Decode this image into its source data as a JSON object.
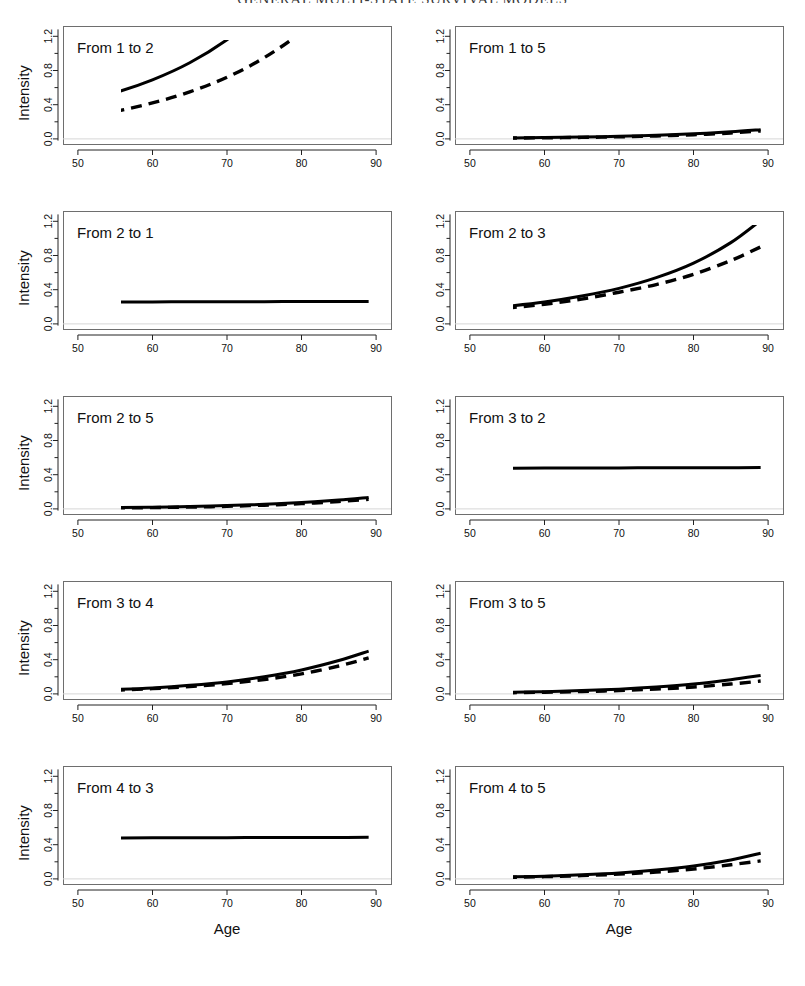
{
  "running_head": "GENERAL MULTI-STATE SURVIVAL MODELS",
  "figure": {
    "x_axis_label": "Age",
    "y_axis_label": "Intensity",
    "x_ticks": [
      "50",
      "60",
      "70",
      "80",
      "90"
    ],
    "y_ticks": [
      "0.0",
      "0.4",
      "0.8",
      "1.2"
    ],
    "x_range": [
      48,
      92
    ],
    "y_range": [
      -0.06,
      1.32
    ],
    "grid": false,
    "legend_position": "none",
    "series_styles": {
      "solid": "solid",
      "dashed": "dashed"
    }
  },
  "chart_data": [
    {
      "type": "line",
      "title": "From 1 to 2",
      "xlabel": "Age",
      "ylabel": "Intensity",
      "xlim": [
        48,
        92
      ],
      "ylim": [
        -0.06,
        1.32
      ],
      "x": [
        50,
        55,
        60,
        65,
        70,
        75,
        80,
        85,
        89
      ],
      "series": [
        {
          "name": "solid",
          "style": "solid",
          "values": [
            0.43,
            0.54,
            0.69,
            0.89,
            1.16,
            1.51,
            1.97,
            2.57,
            3.15
          ]
        },
        {
          "name": "dashed",
          "style": "dashed",
          "values": [
            0.25,
            0.32,
            0.42,
            0.55,
            0.72,
            0.95,
            1.25,
            1.64,
            2.02
          ]
        }
      ]
    },
    {
      "type": "line",
      "title": "From 1 to 5",
      "xlabel": "Age",
      "ylabel": "Intensity",
      "xlim": [
        48,
        92
      ],
      "ylim": [
        -0.06,
        1.32
      ],
      "x": [
        50,
        55,
        60,
        65,
        70,
        75,
        80,
        85,
        89
      ],
      "series": [
        {
          "name": "solid",
          "style": "solid",
          "values": [
            0.008,
            0.011,
            0.015,
            0.021,
            0.03,
            0.042,
            0.059,
            0.083,
            0.108
          ]
        },
        {
          "name": "dashed",
          "style": "dashed",
          "values": [
            0.006,
            0.009,
            0.012,
            0.017,
            0.024,
            0.034,
            0.048,
            0.069,
            0.092
          ]
        }
      ]
    },
    {
      "type": "line",
      "title": "From 2 to 1",
      "xlabel": "Age",
      "ylabel": "Intensity",
      "xlim": [
        48,
        92
      ],
      "ylim": [
        -0.06,
        1.32
      ],
      "x": [
        50,
        55,
        60,
        65,
        70,
        75,
        80,
        85,
        89
      ],
      "series": [
        {
          "name": "solid",
          "style": "solid",
          "values": [
            0.255,
            0.256,
            0.257,
            0.258,
            0.259,
            0.26,
            0.261,
            0.262,
            0.263
          ]
        }
      ]
    },
    {
      "type": "line",
      "title": "From 2 to 3",
      "xlabel": "Age",
      "ylabel": "Intensity",
      "xlim": [
        48,
        92
      ],
      "ylim": [
        -0.06,
        1.32
      ],
      "x": [
        50,
        55,
        60,
        65,
        70,
        75,
        80,
        85,
        89
      ],
      "series": [
        {
          "name": "solid",
          "style": "solid",
          "values": [
            0.165,
            0.205,
            0.255,
            0.325,
            0.415,
            0.54,
            0.71,
            0.95,
            1.21
          ]
        },
        {
          "name": "dashed",
          "style": "dashed",
          "values": [
            0.15,
            0.185,
            0.23,
            0.29,
            0.37,
            0.46,
            0.58,
            0.74,
            0.9
          ]
        }
      ]
    },
    {
      "type": "line",
      "title": "From 2 to 5",
      "xlabel": "Age",
      "ylabel": "Intensity",
      "xlim": [
        48,
        92
      ],
      "ylim": [
        -0.06,
        1.32
      ],
      "x": [
        50,
        55,
        60,
        65,
        70,
        75,
        80,
        85,
        89
      ],
      "series": [
        {
          "name": "solid",
          "style": "solid",
          "values": [
            0.01,
            0.014,
            0.019,
            0.027,
            0.038,
            0.053,
            0.074,
            0.103,
            0.133
          ]
        },
        {
          "name": "dashed",
          "style": "dashed",
          "values": [
            0.008,
            0.011,
            0.015,
            0.021,
            0.03,
            0.043,
            0.061,
            0.086,
            0.112
          ]
        }
      ]
    },
    {
      "type": "line",
      "title": "From 3 to 2",
      "xlabel": "Age",
      "ylabel": "Intensity",
      "xlim": [
        48,
        92
      ],
      "ylim": [
        -0.06,
        1.32
      ],
      "x": [
        50,
        55,
        60,
        65,
        70,
        75,
        80,
        85,
        89
      ],
      "series": [
        {
          "name": "solid",
          "style": "solid",
          "values": [
            0.475,
            0.476,
            0.477,
            0.478,
            0.479,
            0.48,
            0.481,
            0.482,
            0.483
          ]
        }
      ]
    },
    {
      "type": "line",
      "title": "From 3 to 4",
      "xlabel": "Age",
      "ylabel": "Intensity",
      "xlim": [
        48,
        92
      ],
      "ylim": [
        -0.06,
        1.32
      ],
      "x": [
        50,
        55,
        60,
        65,
        70,
        75,
        80,
        85,
        89
      ],
      "series": [
        {
          "name": "solid",
          "style": "solid",
          "values": [
            0.035,
            0.05,
            0.07,
            0.1,
            0.14,
            0.2,
            0.28,
            0.39,
            0.5
          ]
        },
        {
          "name": "dashed",
          "style": "dashed",
          "values": [
            0.03,
            0.043,
            0.061,
            0.086,
            0.12,
            0.168,
            0.234,
            0.326,
            0.42
          ]
        }
      ]
    },
    {
      "type": "line",
      "title": "From 3 to 5",
      "xlabel": "Age",
      "ylabel": "Intensity",
      "xlim": [
        48,
        92
      ],
      "ylim": [
        -0.06,
        1.32
      ],
      "x": [
        50,
        55,
        60,
        65,
        70,
        75,
        80,
        85,
        89
      ],
      "series": [
        {
          "name": "solid",
          "style": "solid",
          "values": [
            0.012,
            0.018,
            0.026,
            0.038,
            0.055,
            0.08,
            0.115,
            0.165,
            0.215
          ]
        },
        {
          "name": "dashed",
          "style": "dashed",
          "values": [
            0.009,
            0.013,
            0.019,
            0.027,
            0.039,
            0.056,
            0.08,
            0.115,
            0.15
          ]
        }
      ]
    },
    {
      "type": "line",
      "title": "From 4 to 3",
      "xlabel": "Age",
      "ylabel": "Intensity",
      "xlim": [
        48,
        92
      ],
      "ylim": [
        -0.06,
        1.32
      ],
      "x": [
        50,
        55,
        60,
        65,
        70,
        75,
        80,
        85,
        89
      ],
      "series": [
        {
          "name": "solid",
          "style": "solid",
          "values": [
            0.478,
            0.479,
            0.48,
            0.481,
            0.482,
            0.483,
            0.484,
            0.485,
            0.486
          ]
        }
      ]
    },
    {
      "type": "line",
      "title": "From 4 to 5",
      "xlabel": "Age",
      "ylabel": "Intensity",
      "xlim": [
        48,
        92
      ],
      "ylim": [
        -0.06,
        1.32
      ],
      "x": [
        50,
        55,
        60,
        65,
        70,
        75,
        80,
        85,
        89
      ],
      "series": [
        {
          "name": "solid",
          "style": "solid",
          "values": [
            0.015,
            0.022,
            0.032,
            0.048,
            0.07,
            0.103,
            0.15,
            0.22,
            0.3
          ]
        },
        {
          "name": "dashed",
          "style": "dashed",
          "values": [
            0.013,
            0.018,
            0.026,
            0.038,
            0.055,
            0.08,
            0.115,
            0.165,
            0.21
          ]
        }
      ]
    }
  ],
  "panel_layout": {
    "rows": 5,
    "cols": 2,
    "y_axis_label_panels": [
      0,
      2,
      4,
      6,
      8
    ],
    "x_axis_label_panels": [
      8,
      9
    ]
  }
}
